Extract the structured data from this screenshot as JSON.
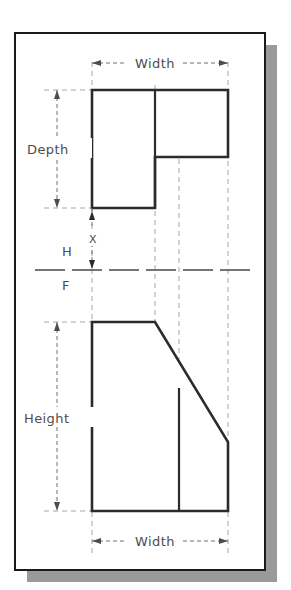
{
  "figure": {
    "paper": {
      "background_color": "#ffffff",
      "border_color": "#1a1a1a",
      "shadow_color": "#9a9a9a",
      "border": {
        "x": 15,
        "y": 33,
        "width": 250,
        "height": 537
      },
      "shadow_offset": {
        "x": 12,
        "y": 12
      }
    },
    "line_colors": {
      "object_line": "#2b2b2b",
      "thin_line": "#6f6f6f",
      "projection_line": "#9d9d9d",
      "fold_line": "#4a4a4a",
      "text": "#4d4d4d"
    },
    "views": {
      "top": {
        "name": "top-view",
        "shape": "L-shaped plan outline with a notched step on the lower right",
        "outline_points": "92,90 228,90 228,157 155,157 155,208 92,208",
        "internal_edge": {
          "x": 155,
          "y1": 90,
          "y2": 208
        }
      },
      "front": {
        "name": "front-view",
        "shape": "Rectangle with a chamfered (angled) upper-right corner",
        "outline_points": "92,322 155,322 228,442 228,511 92,511",
        "internal_edge": {
          "x": 179,
          "y1": 388,
          "y2": 511
        }
      }
    },
    "fold_line": {
      "label_above": "H",
      "label_below": "F",
      "y": 270,
      "x1": 35,
      "x2": 255
    },
    "dimensions": [
      {
        "id": "width-top",
        "label": "Width",
        "orientation": "horizontal",
        "y": 63,
        "x1": 92,
        "x2": 228,
        "applies_to": "top-view"
      },
      {
        "id": "depth",
        "label": "Depth",
        "orientation": "vertical",
        "x": 57,
        "y1": 90,
        "y2": 208,
        "applies_to": "top-view"
      },
      {
        "id": "x-gap",
        "label": "X",
        "orientation": "vertical",
        "x": 92,
        "y1": 208,
        "y2": 270,
        "applies_to": "fold-gap"
      },
      {
        "id": "height",
        "label": "Height",
        "orientation": "vertical",
        "x": 57,
        "y1": 322,
        "y2": 511,
        "applies_to": "front-view"
      },
      {
        "id": "width-bottom",
        "label": "Width",
        "orientation": "horizontal",
        "y": 541,
        "x1": 92,
        "x2": 228,
        "applies_to": "front-view"
      }
    ],
    "projection_lines": [
      {
        "x": 92,
        "y1": 208,
        "y2": 322
      },
      {
        "x": 155,
        "y1": 208,
        "y2": 322
      },
      {
        "x": 179,
        "y1": 157,
        "y2": 322
      },
      {
        "x": 228,
        "y1": 157,
        "y2": 322
      }
    ]
  }
}
